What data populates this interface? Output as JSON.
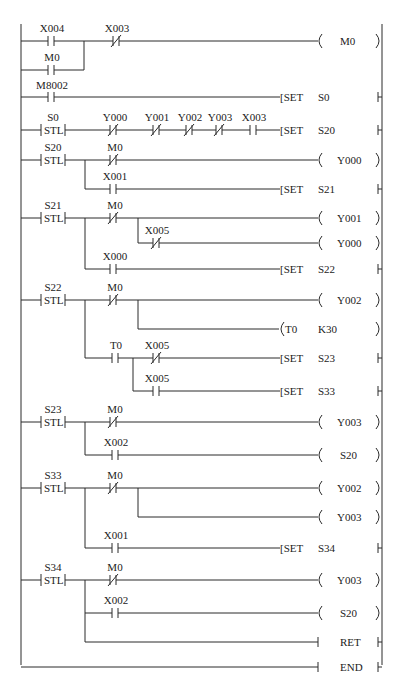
{
  "diagram": {
    "type": "PLC ladder diagram (STL step ladder)",
    "rungs": [
      {
        "id": "r1",
        "contacts": [
          {
            "name": "X004",
            "type": "NO"
          },
          {
            "name": "M0",
            "type": "NO",
            "parallel": true
          },
          {
            "name": "X003",
            "type": "NC"
          }
        ],
        "output": {
          "kind": "coil",
          "text": "M0"
        }
      },
      {
        "id": "r2",
        "contacts": [
          {
            "name": "M8002",
            "type": "NO"
          }
        ],
        "output": {
          "kind": "instr",
          "op": "SET",
          "arg": "S0"
        }
      },
      {
        "id": "r3",
        "stl": "S0",
        "contacts": [
          {
            "name": "Y000",
            "type": "NC"
          },
          {
            "name": "Y001",
            "type": "NC"
          },
          {
            "name": "Y002",
            "type": "NC"
          },
          {
            "name": "Y003",
            "type": "NC"
          },
          {
            "name": "X003",
            "type": "NO"
          }
        ],
        "output": {
          "kind": "instr",
          "op": "SET",
          "arg": "S20"
        }
      },
      {
        "id": "r4",
        "stl": "S20",
        "branches": [
          {
            "contacts": [
              {
                "name": "M0",
                "type": "NC"
              }
            ],
            "output": {
              "kind": "coil",
              "text": "Y000"
            }
          },
          {
            "contacts": [
              {
                "name": "X001",
                "type": "NO"
              }
            ],
            "output": {
              "kind": "instr",
              "op": "SET",
              "arg": "S21"
            }
          }
        ]
      },
      {
        "id": "r5",
        "stl": "S21",
        "branches": [
          {
            "contacts": [
              {
                "name": "M0",
                "type": "NC"
              }
            ],
            "output": {
              "kind": "coil",
              "text": "Y001"
            }
          },
          {
            "contacts": [
              {
                "name": "M0",
                "type": "NC"
              },
              {
                "name": "X005",
                "type": "NC"
              }
            ],
            "output": {
              "kind": "coil",
              "text": "Y000"
            }
          },
          {
            "contacts": [
              {
                "name": "X000",
                "type": "NO"
              }
            ],
            "output": {
              "kind": "instr",
              "op": "SET",
              "arg": "S22"
            }
          }
        ]
      },
      {
        "id": "r6",
        "stl": "S22",
        "branches": [
          {
            "contacts": [
              {
                "name": "M0",
                "type": "NC"
              }
            ],
            "output": {
              "kind": "coil",
              "text": "Y002"
            }
          },
          {
            "contacts": [
              {
                "name": "M0",
                "type": "NC"
              }
            ],
            "output": {
              "kind": "timer",
              "text": "T0",
              "arg": "K30"
            }
          },
          {
            "contacts": [
              {
                "name": "T0",
                "type": "NO"
              },
              {
                "name": "X005",
                "type": "NC"
              }
            ],
            "output": {
              "kind": "instr",
              "op": "SET",
              "arg": "S23"
            }
          },
          {
            "contacts": [
              {
                "name": "T0",
                "type": "NO"
              },
              {
                "name": "X005",
                "type": "NO"
              }
            ],
            "output": {
              "kind": "instr",
              "op": "SET",
              "arg": "S33"
            }
          }
        ]
      },
      {
        "id": "r7",
        "stl": "S23",
        "branches": [
          {
            "contacts": [
              {
                "name": "M0",
                "type": "NC"
              }
            ],
            "output": {
              "kind": "coil",
              "text": "Y003"
            }
          },
          {
            "contacts": [
              {
                "name": "X002",
                "type": "NO"
              }
            ],
            "output": {
              "kind": "coil",
              "text": "S20"
            }
          }
        ]
      },
      {
        "id": "r8",
        "stl": "S33",
        "branches": [
          {
            "contacts": [
              {
                "name": "M0",
                "type": "NC"
              }
            ],
            "output": {
              "kind": "coil",
              "text": "Y002"
            }
          },
          {
            "contacts": [
              {
                "name": "M0",
                "type": "NC"
              }
            ],
            "output": {
              "kind": "coil",
              "text": "Y003"
            }
          },
          {
            "contacts": [
              {
                "name": "X001",
                "type": "NO"
              }
            ],
            "output": {
              "kind": "instr",
              "op": "SET",
              "arg": "S34"
            }
          }
        ]
      },
      {
        "id": "r9",
        "stl": "S34",
        "branches": [
          {
            "contacts": [
              {
                "name": "M0",
                "type": "NC"
              }
            ],
            "output": {
              "kind": "coil",
              "text": "Y003"
            }
          },
          {
            "contacts": [
              {
                "name": "X002",
                "type": "NO"
              }
            ],
            "output": {
              "kind": "coil",
              "text": "S20"
            }
          },
          {
            "contacts": [],
            "output": {
              "kind": "instr",
              "op": "RET"
            }
          }
        ]
      },
      {
        "id": "r10",
        "contacts": [],
        "output": {
          "kind": "instr",
          "op": "END"
        }
      }
    ]
  },
  "labels": {
    "x004": "X004",
    "x003": "X003",
    "m0": "M0",
    "m8002": "M8002",
    "s0": "S0",
    "stl": "STL",
    "y000": "Y000",
    "y001": "Y001",
    "y002": "Y002",
    "y003": "Y003",
    "s20": "S20",
    "s21": "S21",
    "s22": "S22",
    "s23": "S23",
    "s33": "S33",
    "s34": "S34",
    "x000": "X000",
    "x001": "X001",
    "x002": "X002",
    "x005": "X005",
    "t0": "T0",
    "k30": "K30",
    "set": "[SET",
    "ret": "RET",
    "end": "END"
  }
}
